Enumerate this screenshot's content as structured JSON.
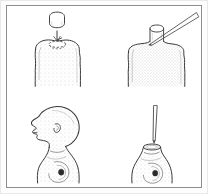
{
  "figure": {
    "kind": "line-drawing-plate",
    "panel_count": 4,
    "has_text_labels": false,
    "frame_color": "#8e8e8e",
    "ink_color": "#333333",
    "stipple_color": "#9a9a9a",
    "background_color": "#ffffff",
    "panels": [
      {
        "id": "panel-top-left",
        "position": "top-left",
        "subject": "fruit-with-cap-removed",
        "elements": [
          {
            "name": "detached-cylindrical-plug",
            "shape": "cylinder"
          },
          {
            "name": "downward-arrow",
            "shape": "arrow-down"
          },
          {
            "name": "dashed-socket-outline",
            "shape": "dashed-ellipse"
          },
          {
            "name": "stippled-fruit-body",
            "shape": "rounded-dome"
          }
        ]
      },
      {
        "id": "panel-top-right",
        "position": "top-right",
        "subject": "fruit-with-plug-inserted-and-needle",
        "elements": [
          {
            "name": "inserted-cylindrical-plug",
            "shape": "cylinder"
          },
          {
            "name": "stippled-fruit-body",
            "shape": "rounded-dome"
          },
          {
            "name": "needle-instrument",
            "shape": "diagonal-tapered-needle"
          }
        ]
      },
      {
        "id": "panel-bottom-left",
        "position": "bottom-left",
        "subject": "infant-head-profile-on-neck",
        "elements": [
          {
            "name": "infant-cranium",
            "shape": "rounded-skull-profile"
          },
          {
            "name": "infant-face-profile",
            "shape": "nose-lips-chin"
          },
          {
            "name": "infant-ear",
            "shape": "small-ear"
          },
          {
            "name": "neck-and-shoulder",
            "shape": "tapered-stump"
          },
          {
            "name": "shoulder-marking",
            "shape": "dark-oval-with-swirl"
          }
        ]
      },
      {
        "id": "panel-bottom-right",
        "position": "bottom-right",
        "subject": "neck-stump-with-vertical-needle",
        "elements": [
          {
            "name": "vertical-needle",
            "shape": "vertical-tapered-needle"
          },
          {
            "name": "cut-neck-opening",
            "shape": "ellipse-opening"
          },
          {
            "name": "neck-and-shoulder",
            "shape": "tapered-stump"
          },
          {
            "name": "shoulder-marking",
            "shape": "dark-oval-with-swirl"
          }
        ]
      }
    ]
  }
}
